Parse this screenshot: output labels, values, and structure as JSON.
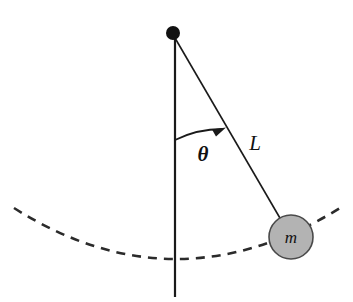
{
  "figure": {
    "type": "physics-diagram",
    "background_color": "#ffffff",
    "width": 353,
    "height": 302
  },
  "labels": {
    "angle": "θ",
    "length": "L",
    "mass": "m"
  },
  "colors": {
    "stroke": "#1a1a1a",
    "pivot_fill": "#111111",
    "bob_fill": "#b3b3b3",
    "bob_stroke": "#4a4a4a",
    "dashed_path": "#2b2b2b"
  },
  "geometry": {
    "pivot": {
      "cx": 173,
      "cy": 33,
      "r": 7
    },
    "vertical_line": {
      "x": 175,
      "y1": 33,
      "y2": 297
    },
    "string": {
      "x1": 175,
      "y1": 38,
      "x2": 291,
      "y2": 237
    },
    "bob": {
      "cx": 291,
      "cy": 237,
      "r": 22
    },
    "angle_arc": {
      "start_x": 175,
      "start_y": 140,
      "end_x": 224,
      "end_y": 128,
      "radius": 107,
      "arrowhead_tip_x": 224,
      "arrowhead_tip_y": 128
    },
    "swing_path": {
      "left_x": 14,
      "left_y": 208,
      "bottom_x": 175,
      "bottom_y": 272,
      "right_x": 340,
      "right_y": 208,
      "dash_pattern": "9 7"
    },
    "label_positions": {
      "angle": {
        "x": 203,
        "y": 161
      },
      "length": {
        "x": 255,
        "y": 150
      },
      "mass": {
        "x": 291,
        "y": 243
      }
    },
    "angle_from_vertical_degrees": 30
  }
}
